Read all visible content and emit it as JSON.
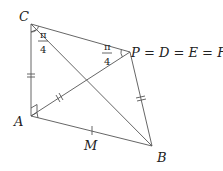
{
  "diagram": {
    "points": {
      "C": {
        "label": "C",
        "x": 31,
        "y": 24
      },
      "P": {
        "label": "P = D = E = F",
        "x": 130,
        "y": 52
      },
      "A": {
        "label": "A",
        "x": 31,
        "y": 116
      },
      "B": {
        "label": "B",
        "x": 152,
        "y": 146
      },
      "M": {
        "label": "M",
        "x": 92,
        "y": 131
      }
    },
    "angles": {
      "C": {
        "numerator": "π",
        "denominator": "4"
      },
      "P": {
        "numerator": "π",
        "denominator": "4"
      },
      "A": {
        "type": "right-angle"
      }
    },
    "segments": [
      "CP",
      "CA",
      "CB",
      "AP",
      "AB",
      "PB"
    ],
    "equal_marks": {
      "single_tick": [
        "AB-midpoint-M"
      ],
      "double_tick": [
        "CA",
        "AP",
        "PB"
      ]
    },
    "colors": {
      "line": "#555555",
      "text": "#222222",
      "background": "#ffffff"
    }
  }
}
